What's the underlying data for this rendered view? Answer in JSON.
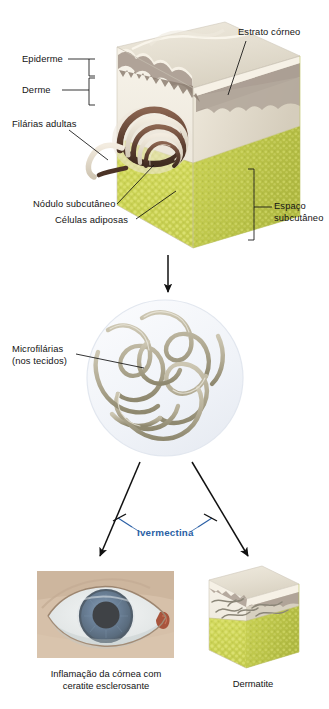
{
  "diagram": {
    "language": "pt-BR",
    "background": "#ffffff",
    "sections": {
      "skin_block": {
        "name": "Bloco de pele em corte (nódulo subcutâneo)",
        "labels": {
          "epidermis": "Epiderme",
          "dermis": "Derme",
          "adult_worms": "Filárias adultas",
          "stratum_corneum": "Estrato córneo",
          "subcut_nodule": "Nódulo subcutâneo",
          "fat_cells": "Células adiposas",
          "subcut_space_line1": "Espaço",
          "subcut_space_line2": "subcutâneo"
        }
      },
      "microfilariae": {
        "name": "Microfilárias nos tecidos",
        "label_line1": "Microfilárias",
        "label_line2": "(nos tecidos)"
      },
      "drug": {
        "name": "Ivermectina bloqueia a progressão",
        "label": "Ivermectina"
      },
      "outcomes": [
        {
          "id": "eye",
          "caption_line1": "Inflamação da córnea com",
          "caption_line2": "ceratite esclerosante"
        },
        {
          "id": "skin",
          "caption_line1": "Dermatite",
          "caption_line2": ""
        }
      ]
    },
    "colors": {
      "drug_blue": "#2a5fa5",
      "fat_yellow": "#ccd455",
      "fat_yellow_dark": "#b9c246",
      "epidermis_gray": "#a89b90",
      "dermis_cream": "#e9e5dc",
      "stratum_cream": "#f6f1e6",
      "worm_brown": "#6b4a3a",
      "worm_cream": "#e8e0d2",
      "microfilaria_tan": "#b5ae98",
      "circle_pale": "#f2f4f8",
      "arrow_black": "#111111",
      "leader_black": "#111111",
      "iris_blue": "#3d5a79",
      "sclera": "#e6e9ea",
      "skin_tone": "#d8c3ae"
    }
  }
}
